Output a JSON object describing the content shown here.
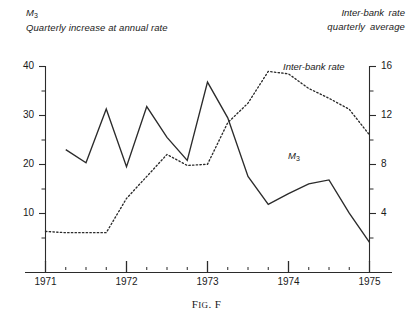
{
  "header": {
    "left_series": "M",
    "left_series_sub": "3",
    "left_subtitle": "Quarterly increase at annual rate",
    "right_series": "Inter-bank rate",
    "right_subtitle": "quarterly  average"
  },
  "caption": {
    "prefix": "F",
    "small_caps": "IG",
    "middle": ". F"
  },
  "inline_labels": {
    "m3": "M",
    "m3_sub": "3",
    "interbank": "Inter-bank rate"
  },
  "axes": {
    "left_ticks": [
      "40",
      "30",
      "20",
      "10"
    ],
    "right_ticks": [
      "16",
      "12",
      "8",
      "4"
    ],
    "x_ticks": [
      "1971",
      "1972",
      "1973",
      "1974",
      "1975"
    ]
  },
  "colors": {
    "ink": "#1a1a1a",
    "axis": "#2b2b2b",
    "m3_line": "#2b2b2b",
    "interbank_line": "#2b2b2b",
    "background": "#ffffff"
  },
  "chart_data": {
    "type": "line",
    "title": "",
    "xlabel": "",
    "ylabel": "Quarterly increase at annual rate",
    "y2label": "Inter-bank rate quarterly average",
    "grid": false,
    "legend": "inline-annotations",
    "xlim": [
      1971.0,
      1975.25
    ],
    "ylim": [
      0,
      40
    ],
    "y2lim": [
      0,
      16
    ],
    "left_tick_values": [
      10,
      20,
      30,
      40
    ],
    "left_minor_tick_values": [
      5,
      15,
      25,
      35
    ],
    "right_tick_values": [
      4,
      8,
      12,
      16
    ],
    "right_minor_tick_values": [
      2,
      6,
      10,
      14
    ],
    "x_tick_values": [
      1971,
      1972,
      1973,
      1974,
      1975
    ],
    "x_minor_tick_values": [
      1971.25,
      1971.5,
      1971.75,
      1972.25,
      1972.5,
      1972.75,
      1973.25,
      1973.5,
      1973.75,
      1974.25,
      1974.5,
      1974.75
    ],
    "series": [
      {
        "name": "M3",
        "axis": "left",
        "style": "solid",
        "x": [
          1971.25,
          1971.5,
          1971.75,
          1972.0,
          1972.25,
          1972.5,
          1972.75,
          1973.0,
          1973.25,
          1973.5,
          1973.75,
          1974.0,
          1974.25,
          1974.5,
          1974.75,
          1975.0
        ],
        "values": [
          23.0,
          20.3,
          31.3,
          19.5,
          31.8,
          25.5,
          20.8,
          36.8,
          29.5,
          17.5,
          11.8,
          14.0,
          16.0,
          16.8,
          10.0,
          4.0
        ]
      },
      {
        "name": "Inter-bank rate",
        "axis": "right",
        "style": "dotted",
        "x": [
          1971.0,
          1971.25,
          1971.5,
          1971.75,
          1972.0,
          1972.25,
          1972.5,
          1972.75,
          1973.0,
          1973.25,
          1973.5,
          1973.75,
          1974.0,
          1974.25,
          1974.5,
          1974.75,
          1975.0
        ],
        "values": [
          2.5,
          2.4,
          2.4,
          2.4,
          5.2,
          7.0,
          8.8,
          7.9,
          8.0,
          11.4,
          13.0,
          15.6,
          15.4,
          14.2,
          13.4,
          12.5,
          10.4
        ]
      }
    ]
  }
}
